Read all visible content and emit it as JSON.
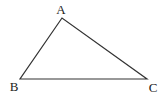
{
  "diagram": {
    "type": "triangle",
    "stroke_color": "#333333",
    "vertices": [
      {
        "label": "A",
        "x": 62,
        "y": 18,
        "label_x": 61,
        "label_y": 14
      },
      {
        "label": "B",
        "x": 20,
        "y": 79,
        "label_x": 14,
        "label_y": 91
      },
      {
        "label": "C",
        "x": 147,
        "y": 79,
        "label_x": 153,
        "label_y": 92
      }
    ]
  }
}
